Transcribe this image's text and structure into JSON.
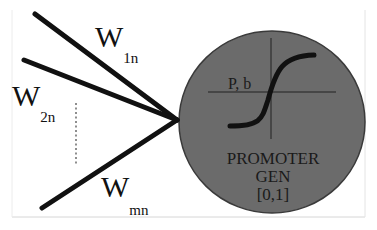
{
  "diagram": {
    "title": "",
    "inputs": [
      {
        "label": "W",
        "subscript": "1n"
      },
      {
        "label": "W",
        "subscript": "2n"
      },
      {
        "label": "W",
        "subscript": "mn"
      }
    ],
    "ellipsis": "⋮",
    "node": {
      "function_label": "P, b",
      "name_line1": "PROMOTER",
      "name_line2": "GEN",
      "range": "[0,1]",
      "fill_color": "#6b6b6b",
      "edge_color": "#2a2a2a"
    },
    "colors": {
      "line": "#111111",
      "frame": "#cfcfcf",
      "background": "#ffffff"
    }
  }
}
